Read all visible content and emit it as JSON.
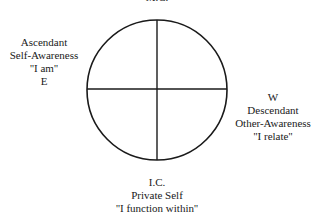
{
  "diagram": {
    "type": "quartered-circle",
    "circle": {
      "cx": 157,
      "cy": 90,
      "r": 70,
      "stroke": "#1a1a1a"
    },
    "top": {
      "lines": [
        "M.C."
      ]
    },
    "left": {
      "lines": [
        "Ascendant",
        "Self-Awareness",
        "''I am''",
        "E"
      ]
    },
    "right": {
      "lines": [
        "W",
        "Descendant",
        "Other-Awareness",
        "''I relate''"
      ]
    },
    "bottom": {
      "lines": [
        "I.C.",
        "Private Self",
        "''I function within''"
      ]
    }
  }
}
